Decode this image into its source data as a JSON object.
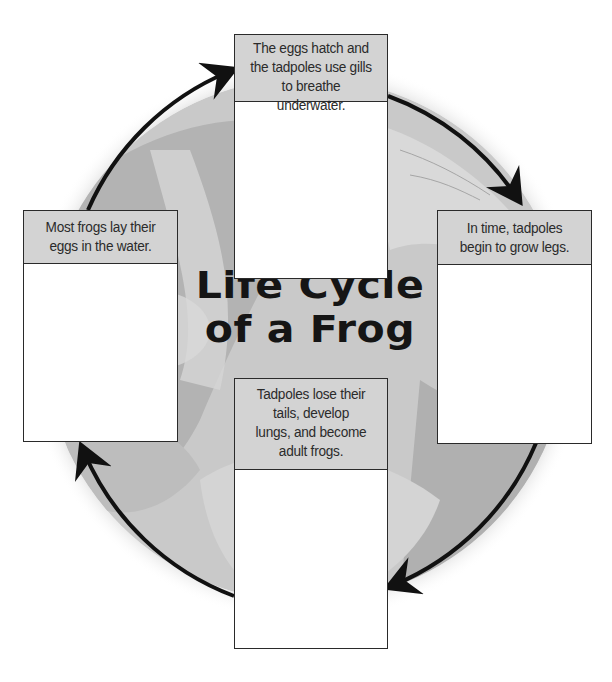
{
  "title": {
    "line1": "Life Cycle",
    "line2": "of a Frog"
  },
  "stages": [
    {
      "position": "top",
      "text": "The eggs hatch and\nthe tadpoles use gills\nto breathe underwater."
    },
    {
      "position": "right",
      "text": "In time, tadpoles\nbegin to grow legs."
    },
    {
      "position": "bottom",
      "text": "Tadpoles lose their\ntails, develop\nlungs, and become\nadult frogs."
    },
    {
      "position": "left",
      "text": "Most frogs lay their\neggs in the water."
    }
  ],
  "arrows": [
    {
      "from": "left",
      "to": "top",
      "icon": "curved-arrow-icon"
    },
    {
      "from": "top",
      "to": "right",
      "icon": "curved-arrow-icon"
    },
    {
      "from": "right",
      "to": "bottom",
      "icon": "curved-arrow-icon"
    },
    {
      "from": "bottom",
      "to": "left",
      "icon": "curved-arrow-icon"
    }
  ],
  "colors": {
    "header_fill": "#d3d3d3",
    "circle_fill": "#c4c4c4",
    "arrow": "#111111",
    "border": "#2a2a2a"
  }
}
